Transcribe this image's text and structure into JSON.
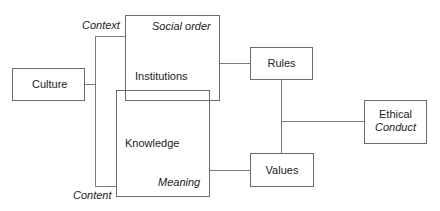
{
  "diagram": {
    "nodes": {
      "culture": {
        "label": "Culture"
      },
      "institutions": {
        "label": "Institutions",
        "corner_label": "Social order"
      },
      "knowledge": {
        "label": "Knowledge",
        "corner_label": "Meaning"
      },
      "rules": {
        "label": "Rules"
      },
      "values": {
        "label": "Values"
      },
      "ethical_conduct": {
        "label_line1": "Ethical",
        "label_line2": "Conduct"
      }
    },
    "bracket_labels": {
      "context": "Context",
      "content": "Content"
    },
    "edges": [
      {
        "from": "culture",
        "to": "bracket"
      },
      {
        "from": "bracket",
        "to": "institutions",
        "label": "Context"
      },
      {
        "from": "bracket",
        "to": "knowledge",
        "label": "Content"
      },
      {
        "from": "institutions",
        "to": "rules"
      },
      {
        "from": "knowledge",
        "to": "values"
      },
      {
        "from": "rules",
        "to": "values"
      },
      {
        "from": "rules-values-link",
        "to": "ethical_conduct"
      }
    ]
  }
}
